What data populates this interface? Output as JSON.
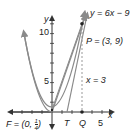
{
  "figure": {
    "axes": {
      "x_label": "x",
      "y_label": "y",
      "x_tick_label": "5",
      "y_tick_labels": [
        "10",
        "5"
      ]
    },
    "labels": {
      "line_equation": "y = 6x − 9",
      "point_p": "P = (3, 9)",
      "vertical_line": "x = 3",
      "point_t": "T",
      "point_q": "Q",
      "focus_prefix": "F = (0, ",
      "focus_num": "1",
      "focus_den": "4",
      "focus_suffix": ")"
    },
    "colors": {
      "curve": "#8a8a8a",
      "axis": "#333333",
      "point": "#222222",
      "dashed": "#999999"
    }
  }
}
